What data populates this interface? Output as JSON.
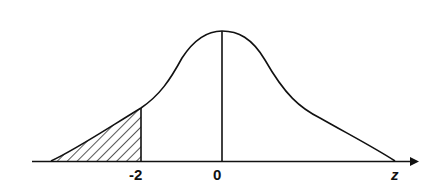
{
  "diagram": {
    "type": "normal-distribution-curve",
    "shaded_region": "left tail, z < -2",
    "axis_label": "z",
    "tick_labels": [
      "-2",
      "0"
    ],
    "colors": {
      "stroke": "#111111",
      "background": "#ffffff"
    }
  },
  "labels": {
    "neg_two": "-2",
    "zero": "0",
    "z": "z"
  }
}
